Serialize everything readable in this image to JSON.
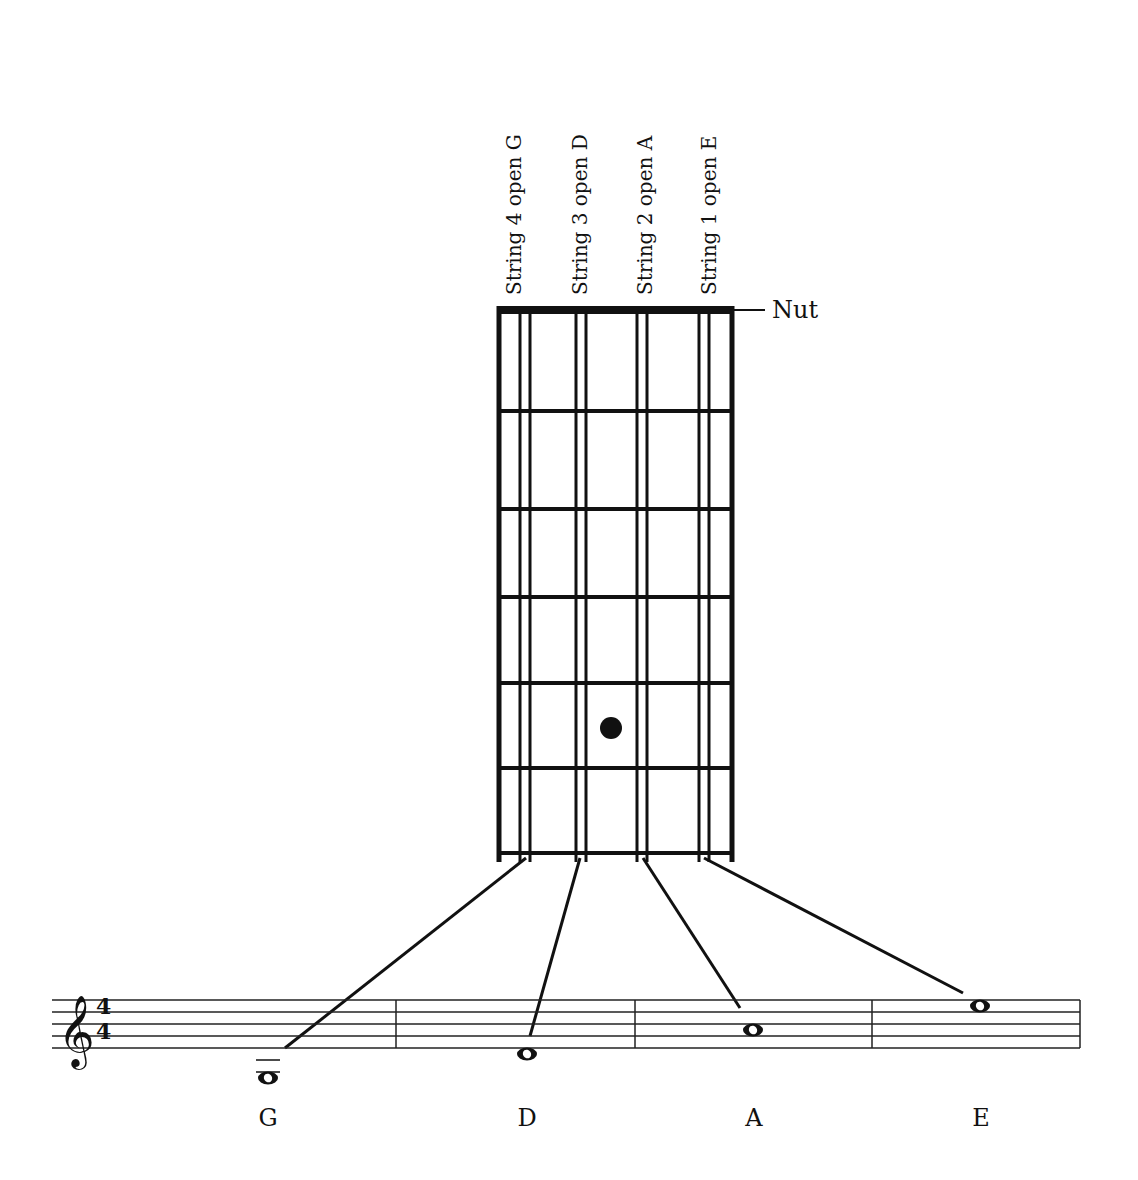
{
  "diagram": {
    "nut_label": "Nut",
    "strings": [
      {
        "label": "String 4 open G",
        "note": "G",
        "x": 525
      },
      {
        "label": "String 3 open D",
        "note": "D",
        "x": 581
      },
      {
        "label": "String 2 open A",
        "note": "A",
        "x": 642
      },
      {
        "label": "String 1 open E",
        "note": "E",
        "x": 704
      }
    ],
    "fretboard": {
      "left": 499,
      "right": 732,
      "nut_top": 306,
      "nut_bottom": 314,
      "frets_y": [
        411,
        509,
        597,
        683,
        768,
        853
      ],
      "bottom": 862
    },
    "fret_marker": {
      "cx": 611,
      "cy": 728,
      "r": 11
    },
    "staff": {
      "clef": "treble",
      "time_signature": {
        "top": "4",
        "bottom": "4"
      },
      "x_start": 52,
      "x_end": 1080,
      "lines_y": [
        1000,
        1012,
        1024,
        1036,
        1048
      ],
      "barlines_x": [
        396,
        635,
        872,
        1080
      ]
    },
    "notes": [
      {
        "name": "G",
        "x": 268,
        "y": 1078,
        "ledger": true,
        "label_y": 1108
      },
      {
        "name": "D",
        "x": 527,
        "y": 1054,
        "ledger": false,
        "label_y": 1108
      },
      {
        "name": "A",
        "x": 753,
        "y": 1030,
        "ledger": false,
        "label_y": 1108
      },
      {
        "name": "E",
        "x": 980,
        "y": 1006,
        "ledger": false,
        "label_y": 1108
      }
    ],
    "connectors": [
      {
        "from": [
          526,
          858
        ],
        "to": [
          285,
          1048
        ]
      },
      {
        "from": [
          580,
          858
        ],
        "to": [
          530,
          1036
        ]
      },
      {
        "from": [
          643,
          858
        ],
        "to": [
          740,
          1008
        ]
      },
      {
        "from": [
          704,
          858
        ],
        "to": [
          963,
          993
        ]
      }
    ]
  }
}
